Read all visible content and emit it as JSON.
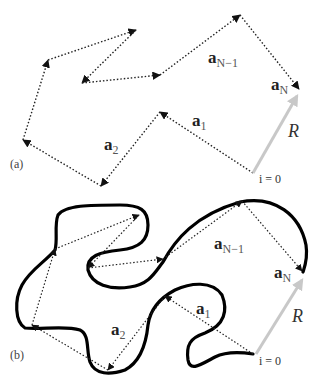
{
  "panels": [
    {
      "id": "a",
      "label": "(a)",
      "description": "Freely jointed chain of bond vectors",
      "bond_labels": {
        "a1": {
          "base": "a",
          "sub": "1"
        },
        "a2": {
          "base": "a",
          "sub": "2"
        },
        "aN1": {
          "base": "a",
          "sub": "N−1"
        },
        "aN": {
          "base": "a",
          "sub": "N"
        }
      },
      "end_to_end_label": "R",
      "start_label": "i = 0",
      "walk_points": [
        [
          253,
          173
        ],
        [
          160,
          112
        ],
        [
          101,
          186
        ],
        [
          23,
          140
        ],
        [
          48,
          60
        ],
        [
          136,
          30
        ],
        [
          82,
          83
        ],
        [
          160,
          75
        ],
        [
          240,
          15
        ],
        [
          299,
          90
        ]
      ]
    },
    {
      "id": "b",
      "label": "(b)",
      "description": "Continuous polymer contour overlaid on bond vectors",
      "bond_labels": {
        "a1": {
          "base": "a",
          "sub": "1"
        },
        "a2": {
          "base": "a",
          "sub": "2"
        },
        "aN1": {
          "base": "a",
          "sub": "N−1"
        },
        "aN": {
          "base": "a",
          "sub": "N"
        }
      },
      "end_to_end_label": "R",
      "start_label": "i = 0",
      "walk_points": [
        [
          253,
          354
        ],
        [
          165,
          296
        ],
        [
          108,
          370
        ],
        [
          32,
          325
        ],
        [
          55,
          249
        ],
        [
          139,
          215
        ],
        [
          88,
          268
        ],
        [
          163,
          259
        ],
        [
          242,
          201
        ],
        [
          303,
          272
        ]
      ]
    }
  ],
  "colors": {
    "dotted": "#222222",
    "contour": "#000000",
    "R_arrow": "#c8c8c8",
    "text": "#222222"
  }
}
